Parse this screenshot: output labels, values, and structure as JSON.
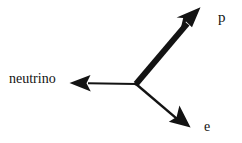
{
  "diagram": {
    "background_color": "#ffffff",
    "stroke_color": "#131313",
    "vertex": {
      "x": 136,
      "y": 84
    },
    "vectors": [
      {
        "id": "proton",
        "label": "p",
        "particle": "proton",
        "tip": {
          "x": 200,
          "y": 8
        },
        "shaft_width": 6,
        "arrowhead_length": 22,
        "arrowhead_half_width": 9,
        "weight": "thick",
        "direction_deg": -49.9,
        "label_position": {
          "x": 218,
          "y": 10
        }
      },
      {
        "id": "neutrino",
        "label": "neutrino",
        "particle": "neutrino",
        "tip": {
          "x": 70,
          "y": 83
        },
        "shaft_width": 2,
        "arrowhead_length": 18,
        "arrowhead_half_width": 8,
        "weight": "thin",
        "direction_deg": 180.9,
        "label_position": {
          "x": 9,
          "y": 72
        }
      },
      {
        "id": "electron",
        "label": "e",
        "particle": "electron",
        "tip": {
          "x": 190,
          "y": 127
        },
        "shaft_width": 2.4,
        "arrowhead_length": 18,
        "arrowhead_half_width": 8,
        "weight": "thin",
        "direction_deg": 40.4,
        "label_position": {
          "x": 204,
          "y": 120
        }
      }
    ]
  }
}
